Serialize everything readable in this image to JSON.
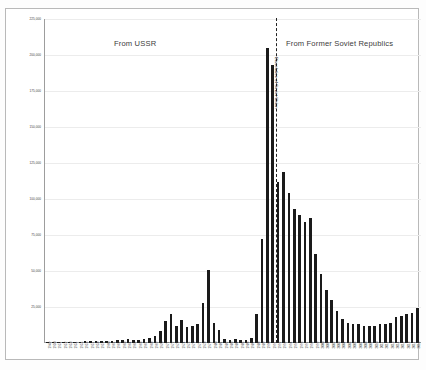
{
  "figure": {
    "background": "#ffffff",
    "bar_color": "#1a1a1a",
    "grid_color": "#ececec",
    "divider_color": "#222222"
  },
  "titles": {
    "left": "From USSR",
    "right": "From Former Soviet Republics"
  },
  "annotation": {
    "divider_label": "Dissolution of Soviet Union",
    "divider_year": 1991
  },
  "chart_data": {
    "type": "bar",
    "title": "",
    "subtitle": "",
    "xlabel": "",
    "ylabel": "",
    "ylim": [
      0,
      225000
    ],
    "grid": true,
    "legend": "none",
    "yticks": [
      225000,
      200000,
      175000,
      150000,
      125000,
      100000,
      75000,
      50000,
      25000
    ],
    "ytick_labels": [
      "225,000",
      "200,000",
      "175,000",
      "150,000",
      "125,000",
      "100,000",
      "75,000",
      "50,000",
      "25,000"
    ],
    "annotations": [
      {
        "text": "From USSR",
        "position": "top-left-panel"
      },
      {
        "text": "From Former Soviet Republics",
        "position": "top-right-panel"
      },
      {
        "text": "Dissolution of Soviet Union",
        "position": "vertical-dashed-line-1991"
      }
    ],
    "categories": [
      "1949",
      "1950",
      "1951",
      "1952",
      "1953",
      "1954",
      "1955",
      "1956",
      "1957",
      "1958",
      "1959",
      "1960",
      "1961",
      "1962",
      "1963",
      "1964",
      "1965",
      "1966",
      "1967",
      "1968",
      "1969",
      "1970",
      "1971",
      "1972",
      "1973",
      "1974",
      "1975",
      "1976",
      "1977",
      "1978",
      "1979",
      "1980",
      "1981",
      "1982",
      "1983",
      "1984",
      "1985",
      "1986",
      "1987",
      "1988",
      "1989",
      "1990",
      "1991",
      "1992",
      "1993",
      "1994",
      "1995",
      "1996",
      "1997",
      "1998",
      "1999",
      "2000",
      "2001",
      "2002",
      "2003",
      "2004",
      "2005",
      "2006",
      "2007",
      "2008",
      "2009",
      "2010",
      "2011",
      "2012",
      "2013",
      "2014",
      "2015",
      "2016",
      "2017",
      "2018"
    ],
    "values": [
      500,
      600,
      700,
      800,
      700,
      900,
      1000,
      1200,
      1100,
      1300,
      1400,
      1500,
      1600,
      1800,
      2000,
      2500,
      2200,
      2400,
      2600,
      3500,
      5200,
      8500,
      15000,
      20000,
      12000,
      16000,
      11000,
      12000,
      13000,
      28000,
      51000,
      14000,
      9000,
      3000,
      2000,
      2500,
      2000,
      2200,
      3500,
      20000,
      72000,
      205000,
      193000,
      112000,
      119000,
      104000,
      93000,
      89000,
      84000,
      87000,
      62000,
      48000,
      37000,
      30000,
      22000,
      17000,
      14000,
      13000,
      13000,
      12000,
      12000,
      12000,
      13000,
      13000,
      14000,
      18000,
      19000,
      20000,
      21000,
      24000
    ],
    "series": [
      {
        "name": "Immigrants from USSR / Former Soviet Republics",
        "values": [
          500,
          600,
          700,
          800,
          700,
          900,
          1000,
          1200,
          1100,
          1300,
          1400,
          1500,
          1600,
          1800,
          2000,
          2500,
          2200,
          2400,
          2600,
          3500,
          5200,
          8500,
          15000,
          20000,
          12000,
          16000,
          11000,
          12000,
          13000,
          28000,
          51000,
          14000,
          9000,
          3000,
          2000,
          2500,
          2000,
          2200,
          3500,
          20000,
          72000,
          205000,
          193000,
          112000,
          119000,
          104000,
          93000,
          89000,
          84000,
          87000,
          62000,
          48000,
          37000,
          30000,
          22000,
          17000,
          14000,
          13000,
          13000,
          12000,
          12000,
          12000,
          13000,
          13000,
          14000,
          18000,
          19000,
          20000,
          21000,
          24000
        ]
      }
    ]
  }
}
